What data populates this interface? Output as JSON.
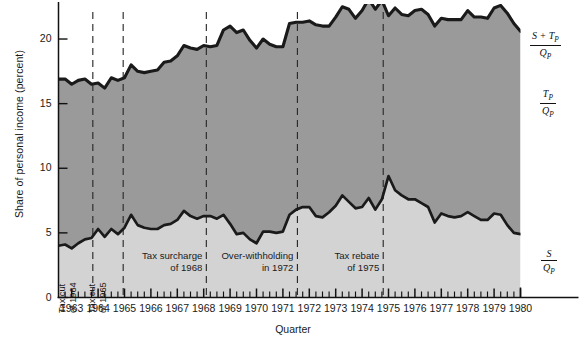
{
  "chart_data": {
    "type": "area",
    "title": "",
    "xlabel": "Quarter",
    "ylabel": "Share of personal income (percent)",
    "ylim": [
      0,
      22.4
    ],
    "yticks": [
      0,
      5,
      10,
      15,
      20
    ],
    "ytick_labels": [
      "0",
      "5",
      "10",
      "15",
      "20"
    ],
    "xlim": [
      1962.5,
      1980.0
    ],
    "xtick_labels": [
      "1963",
      "1964",
      "1965",
      "1966",
      "1967",
      "1968",
      "1969",
      "1970",
      "1971",
      "1972",
      "1973",
      "1974",
      "1975",
      "1976",
      "1977",
      "1978",
      "1979",
      "1980"
    ],
    "xtick_values": [
      1963,
      1964,
      1965,
      1966,
      1967,
      1968,
      1969,
      1970,
      1971,
      1972,
      1973,
      1974,
      1975,
      1976,
      1977,
      1978,
      1979,
      1980
    ],
    "minor_tick_interval_years": 0.25,
    "grid": false,
    "legend_position": "right-of-plot",
    "x": [
      1962.5,
      1962.75,
      1963.0,
      1963.25,
      1963.5,
      1963.75,
      1964.0,
      1964.25,
      1964.5,
      1964.75,
      1965.0,
      1965.25,
      1965.5,
      1965.75,
      1966.0,
      1966.25,
      1966.5,
      1966.75,
      1967.0,
      1967.25,
      1967.5,
      1967.75,
      1968.0,
      1968.25,
      1968.5,
      1968.75,
      1969.0,
      1969.25,
      1969.5,
      1969.75,
      1970.0,
      1970.25,
      1970.5,
      1970.75,
      1971.0,
      1971.25,
      1971.5,
      1971.75,
      1972.0,
      1972.25,
      1972.5,
      1972.75,
      1973.0,
      1973.25,
      1973.5,
      1973.75,
      1974.0,
      1974.25,
      1974.5,
      1974.75,
      1975.0,
      1975.25,
      1975.5,
      1975.75,
      1976.0,
      1976.25,
      1976.5,
      1976.75,
      1977.0,
      1977.25,
      1977.5,
      1977.75,
      1978.0,
      1978.25,
      1978.5,
      1978.75,
      1979.0,
      1979.25,
      1979.5,
      1979.75,
      1980.0
    ],
    "series": [
      {
        "name": "S/Q_P",
        "legend_numerator": "S",
        "legend_denominator": "Q_P",
        "fill_color": "#d3d3d3",
        "line_color": "#1a1a1a",
        "values": [
          4.0,
          4.1,
          3.8,
          4.2,
          4.5,
          4.6,
          5.3,
          4.7,
          5.3,
          4.9,
          5.4,
          6.4,
          5.6,
          5.4,
          5.3,
          5.3,
          5.6,
          5.7,
          6.0,
          6.7,
          6.3,
          6.1,
          6.3,
          6.3,
          6.1,
          6.4,
          5.7,
          4.9,
          5.0,
          4.5,
          4.2,
          5.1,
          5.1,
          5.0,
          5.1,
          6.4,
          6.8,
          7.0,
          7.0,
          6.3,
          6.2,
          6.6,
          7.1,
          7.9,
          7.4,
          6.9,
          7.0,
          7.7,
          6.8,
          7.6,
          9.4,
          8.3,
          7.9,
          7.6,
          7.6,
          7.3,
          7.0,
          5.8,
          6.5,
          6.3,
          6.2,
          6.3,
          6.6,
          6.3,
          6.0,
          6.0,
          6.5,
          6.4,
          5.6,
          5.0,
          4.9
        ]
      },
      {
        "name": "T_P/Q_P",
        "legend_numerator": "T_P",
        "legend_denominator": "Q_P",
        "fill_color": "#9a9a9a",
        "line_color": "#1a1a1a",
        "values": [
          12.9,
          12.8,
          12.7,
          12.6,
          12.4,
          11.9,
          11.3,
          11.5,
          11.7,
          11.9,
          11.6,
          11.6,
          11.9,
          12.0,
          12.2,
          12.3,
          12.6,
          12.6,
          12.7,
          12.8,
          13.0,
          13.1,
          13.2,
          13.1,
          13.4,
          14.3,
          15.3,
          15.6,
          15.7,
          15.4,
          15.1,
          14.9,
          14.5,
          14.4,
          14.3,
          14.8,
          14.5,
          14.3,
          14.4,
          14.8,
          14.8,
          14.4,
          14.6,
          14.6,
          14.9,
          14.7,
          15.2,
          15.4,
          15.5,
          15.4,
          12.4,
          14.1,
          14.0,
          14.2,
          14.6,
          15.0,
          14.9,
          15.2,
          15.1,
          15.2,
          15.3,
          15.2,
          15.6,
          15.4,
          15.7,
          15.6,
          15.9,
          16.2,
          16.4,
          16.2,
          15.7
        ]
      }
    ],
    "total_series": {
      "name": "S+T_P/Q_P",
      "legend_numerator": "S + T_P",
      "legend_denominator": "Q_P",
      "line_color": "#1a1a1a",
      "note": "sum of the two component series"
    },
    "events": [
      {
        "label_line1": "Tax cut",
        "label_line2": "of 1964",
        "x": 1963.8,
        "orientation": "vertical"
      },
      {
        "label_line1": "Tax cut",
        "label_line2": "of 1965",
        "x": 1964.95,
        "orientation": "vertical"
      },
      {
        "label_line1": "Tax surcharge",
        "label_line2": "of 1968",
        "x": 1968.1,
        "orientation": "horizontal"
      },
      {
        "label_line1": "Over-withholding",
        "label_line2": "in 1972",
        "x": 1971.55,
        "orientation": "horizontal"
      },
      {
        "label_line1": "Tax rebate",
        "label_line2": "of 1975",
        "x": 1974.8,
        "orientation": "horizontal"
      }
    ]
  }
}
